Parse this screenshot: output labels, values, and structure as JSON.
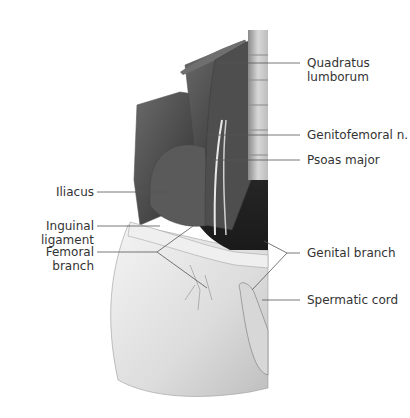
{
  "figure": {
    "colors": {
      "label_text": "#333333",
      "leader_line": "#555555",
      "muscle_dark": "#3a3a3a",
      "skin_light": "#e6e6e6"
    }
  },
  "labels": [
    {
      "id": "quadratus-lumborum",
      "lines": [
        "Quadratus",
        "lumborum"
      ],
      "side": "right"
    },
    {
      "id": "genitofemoral-n",
      "lines": [
        "Genitofemoral n."
      ],
      "side": "right"
    },
    {
      "id": "psoas-major",
      "lines": [
        "Psoas major"
      ],
      "side": "right"
    },
    {
      "id": "genital-branch",
      "lines": [
        "Genital branch"
      ],
      "side": "right"
    },
    {
      "id": "spermatic-cord",
      "lines": [
        "Spermatic cord"
      ],
      "side": "right"
    },
    {
      "id": "iliacus",
      "lines": [
        "Iliacus"
      ],
      "side": "left"
    },
    {
      "id": "inguinal-ligament",
      "lines": [
        "Inguinal",
        "ligament"
      ],
      "side": "left"
    },
    {
      "id": "femoral-branch",
      "lines": [
        "Femoral",
        "branch"
      ],
      "side": "left"
    }
  ]
}
